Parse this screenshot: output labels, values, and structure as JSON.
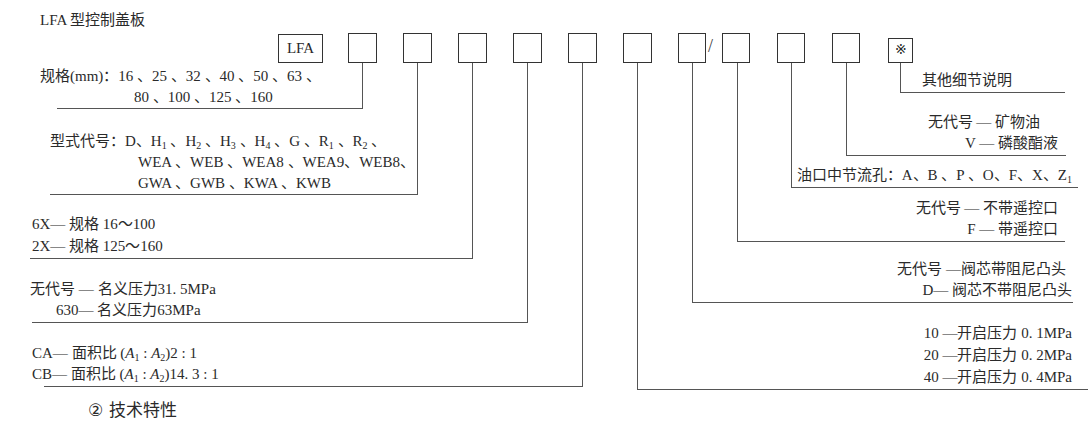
{
  "title": "LFA 型控制盖板",
  "code_boxes": {
    "prefix": "LFA",
    "slash": "/",
    "note_symbol": "※",
    "blank_count": 10
  },
  "left_fields": {
    "spec": {
      "label": "规格(mm)：",
      "line1": "16 、25 、32 、40 、50 、63 、",
      "line2": "80 、100 、125 、160"
    },
    "type_code": {
      "label": "型式代号：",
      "line1_parts": [
        "D、H",
        "1",
        " 、H",
        "2",
        " 、H",
        "3",
        " 、H",
        "4",
        " 、G 、R",
        "1",
        " 、R",
        "2",
        " 、"
      ],
      "line2": "WEA 、WEB 、WEA8 、WEA9、WEB8、",
      "line3": "GWA 、GWB 、KWA 、KWB"
    },
    "series": {
      "line1": "6X— 规格 16～100",
      "line2": "2X— 规格 125～160"
    },
    "pressure": {
      "line1": "无代号 — 名义压力31. 5MPa",
      "line2": "630— 名义压力63MPa"
    },
    "area_ratio": {
      "ca_prefix": "CA— 面积比 (",
      "ca_suffix": ")2 : 1",
      "cb_prefix": "CB— 面积比 (",
      "cb_suffix": ")14. 3 : 1",
      "a1": "A",
      "a1_sub": "1",
      "sep": " : ",
      "a2": "A",
      "a2_sub": "2"
    }
  },
  "right_fields": {
    "other_details": "其他细节说明",
    "fluid": {
      "line1": "无代号 — 矿物油",
      "line2": "V — 磷酸酯液"
    },
    "orifice": {
      "text": "油口中节流孔：A、B 、P 、O、F、X、Z",
      "sub": "1"
    },
    "remote": {
      "line1": "无代号 — 不带遥控口",
      "line2": "F — 带遥控口"
    },
    "damping": {
      "line1": "无代号 —阀芯带阻尼凸头",
      "line2": "D— 阀芯不带阻尼凸头"
    },
    "cracking_pressure": {
      "line1": "10 —开启压力 0. 1MPa",
      "line2": "20 —开启压力 0. 2MPa",
      "line3": "40 —开启压力 0. 4MPa"
    }
  },
  "footer_heading": "② 技术特性"
}
